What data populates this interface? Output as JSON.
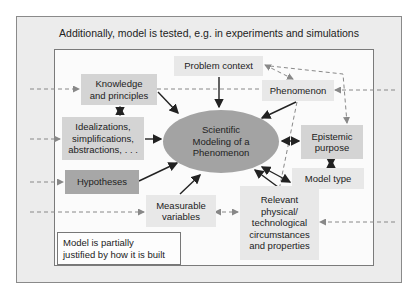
{
  "title": "Additionally, model is tested, e.g. in experiments and simulations",
  "center": {
    "line1": "Scientific",
    "line2": "Modeling of a",
    "line3": "Phenomenon"
  },
  "nodes": {
    "problem_context": {
      "label": "Problem context"
    },
    "phenomenon": {
      "label": "Phenomenon"
    },
    "knowledge": {
      "line1": "Knowledge",
      "line2": "and principles"
    },
    "idealizations": {
      "line1": "Idealizations,",
      "line2": "simplifications,",
      "line3": "abstractions, . . ."
    },
    "hypotheses": {
      "label": "Hypotheses"
    },
    "epistemic_purpose": {
      "line1": "Epistemic",
      "line2": "purpose"
    },
    "model_type": {
      "label": "Model type"
    },
    "measurable_variables": {
      "line1": "Measurable",
      "line2": "variables"
    },
    "relevant": {
      "line1": "Relevant",
      "line2": "physical/",
      "line3": "technological",
      "line4": "circumstances",
      "line5": "and properties"
    }
  },
  "note": {
    "line1": "Model is partially",
    "line2": "justified by how it is built"
  },
  "colors": {
    "outer_bg": "#ececec",
    "inner_bg": "#fbfbfb",
    "ellipse": "#a3a3a3",
    "dark_box": "#a7a7a7",
    "mid_box": "#d4d4d4",
    "light_box": "#e8e8e8",
    "arrow": "#222222",
    "dashed_arrow": "#777777"
  }
}
